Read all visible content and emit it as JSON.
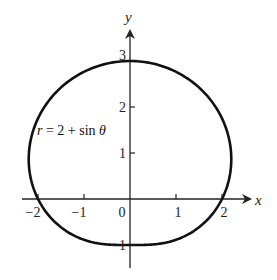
{
  "chart_data": {
    "type": "line",
    "title": "",
    "equation": "r = 2 + sin θ",
    "equation_parts": {
      "r": "r",
      "rest": " = 2 + sin ",
      "theta": "θ"
    },
    "xlabel": "x",
    "ylabel": "y",
    "xlim": [
      -2.25,
      2.6
    ],
    "ylim": [
      -1.4,
      3.6
    ],
    "x_ticks": [
      {
        "value": -2,
        "label": "−2"
      },
      {
        "value": -1,
        "label": "−1"
      },
      {
        "value": 0,
        "label": "0"
      },
      {
        "value": 1,
        "label": "1"
      },
      {
        "value": 2,
        "label": "2"
      }
    ],
    "y_ticks": [
      {
        "value": -1,
        "label": "−1"
      },
      {
        "value": 1,
        "label": "1"
      },
      {
        "value": 2,
        "label": "2"
      },
      {
        "value": 3,
        "label": "3"
      }
    ],
    "grid": false,
    "legend": null,
    "series": [
      {
        "name": "r = 2 + sin θ",
        "polar": true,
        "r_formula": "2 + sin(theta)",
        "theta_range": [
          0,
          6.2832
        ],
        "key_points": [
          {
            "theta": "0",
            "x": 2,
            "y": 0
          },
          {
            "theta": "π/2",
            "x": 0,
            "y": 3
          },
          {
            "theta": "π",
            "x": -2,
            "y": 0
          },
          {
            "theta": "3π/2",
            "x": 0,
            "y": -1
          }
        ]
      }
    ]
  },
  "colors": {
    "curve": "#111111",
    "axis": "#222222",
    "background": "#ffffff"
  }
}
